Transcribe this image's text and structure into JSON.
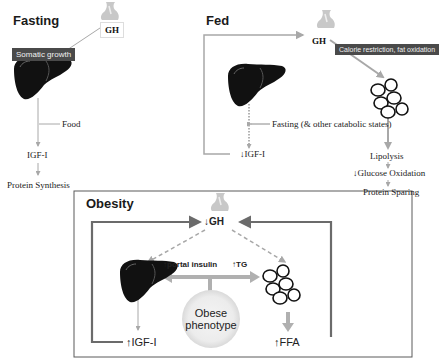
{
  "panels": {
    "fasting": {
      "title": "Fasting",
      "gh_label": "GH",
      "somatic_label": "Somatic growth",
      "food_label": "Food",
      "igf_label": "IGF-I",
      "protein_label": "Protein Synthesis"
    },
    "fed": {
      "title": "Fed",
      "gh_label": "GH",
      "calorie_label": "Calorie restriction, fat oxidation",
      "fasting_label": "Fasting",
      "fasting_sub_label": "(& other catabolic states)",
      "igf_label": "↓IGF-I",
      "lipolysis_label": "Lipolysis",
      "glucose_label": "↓Glucose Oxidation",
      "protein_sparing_label": "Protein Sparing"
    },
    "obesity": {
      "title": "Obesity",
      "gh_label": "↓GH",
      "portal_insulin_label": "↑portal insulin",
      "tg_label": "↑TG",
      "obese_line1": "Obese",
      "obese_line2": "phenotype",
      "igf_label": "↑IGF-I",
      "ffa_label": "↑FFA"
    }
  },
  "colors": {
    "arrow_gray": "#a8a8a8",
    "dark_gray_box": "#4a4a4a",
    "obesity_frame": "#6b6b6b",
    "liver": "#111111"
  }
}
